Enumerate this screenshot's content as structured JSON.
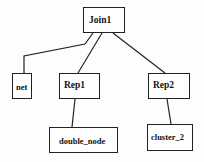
{
  "diagram": {
    "type": "tree",
    "nodes": [
      {
        "id": "join1",
        "label": "Join1"
      },
      {
        "id": "net",
        "label": "net"
      },
      {
        "id": "rep1",
        "label": "Rep1"
      },
      {
        "id": "rep2",
        "label": "Rep2"
      },
      {
        "id": "double_node",
        "label": "double_node"
      },
      {
        "id": "cluster_2",
        "label": "cluster_2"
      }
    ],
    "edges": [
      {
        "from": "Join1",
        "to": "net"
      },
      {
        "from": "Join1",
        "to": "Rep1"
      },
      {
        "from": "Join1",
        "to": "Rep2"
      },
      {
        "from": "Rep1",
        "to": "double_node"
      },
      {
        "from": "Rep2",
        "to": "cluster_2"
      }
    ]
  }
}
